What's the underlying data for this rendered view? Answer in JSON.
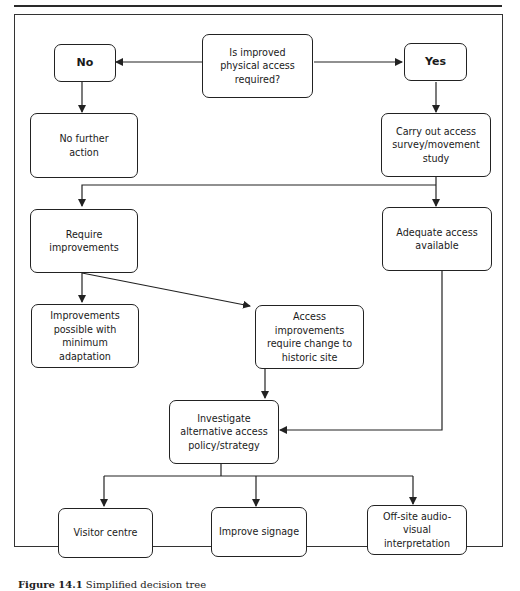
{
  "figure": {
    "caption_label": "Figure 14.1",
    "caption_text": "Simplified decision tree"
  },
  "nodes": {
    "question": "Is improved\nphysical access\nrequired?",
    "no": "No",
    "yes": "Yes",
    "no_further_action": "No further\naction",
    "access_survey": "Carry out access\nsurvey/movement\nstudy",
    "require_improvements": "Require\nimprovements",
    "adequate_access": "Adequate access\navailable",
    "minimum_adaptation": "Improvements\npossible with\nminimum\nadaptation",
    "change_historic_site": "Access\nimprovements\nrequire change to\nhistoric site",
    "investigate_alternative": "Investigate\nalternative access\npolicy/strategy",
    "visitor_centre": "Visitor centre",
    "improve_signage": "Improve signage",
    "offsite_av": "Off-site audio-\nvisual\ninterpretation"
  },
  "edges": [
    {
      "from": "question",
      "to": "no"
    },
    {
      "from": "question",
      "to": "yes"
    },
    {
      "from": "no",
      "to": "no_further_action"
    },
    {
      "from": "yes",
      "to": "access_survey"
    },
    {
      "from": "access_survey",
      "to": "require_improvements"
    },
    {
      "from": "access_survey",
      "to": "adequate_access"
    },
    {
      "from": "require_improvements",
      "to": "minimum_adaptation"
    },
    {
      "from": "require_improvements",
      "to": "change_historic_site"
    },
    {
      "from": "change_historic_site",
      "to": "investigate_alternative"
    },
    {
      "from": "adequate_access",
      "to": "investigate_alternative"
    },
    {
      "from": "investigate_alternative",
      "to": "visitor_centre"
    },
    {
      "from": "investigate_alternative",
      "to": "improve_signage"
    },
    {
      "from": "investigate_alternative",
      "to": "offsite_av"
    }
  ],
  "colors": {
    "line": "#222222",
    "background": "#ffffff"
  }
}
